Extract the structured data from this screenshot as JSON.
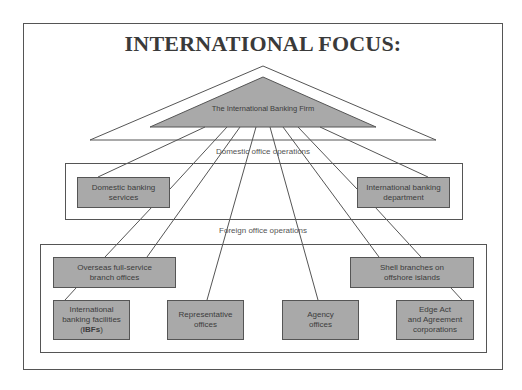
{
  "title": "INTERNATIONAL FOCUS:",
  "firm": {
    "label": "The International Banking Firm"
  },
  "domestic": {
    "section_label": "Domestic office operations",
    "boxes": [
      {
        "line1": "Domestic banking",
        "line2": "services"
      },
      {
        "line1": "International banking",
        "line2": "department"
      }
    ]
  },
  "foreign": {
    "section_label": "Foreign office operations",
    "boxes": [
      {
        "line1": "Overseas full-service",
        "line2": "branch offices"
      },
      {
        "line1": "Shell branches on",
        "line2": "offshore islands"
      },
      {
        "line1": "International",
        "line2": "banking facilities",
        "line3_pre": "(",
        "line3_bold": "IBFs",
        "line3_post": ")"
      },
      {
        "line1": "Representative",
        "line2": "offices"
      },
      {
        "line1": "Agency",
        "line2": "offices"
      },
      {
        "line1": "Edge Act",
        "line2": "and Agreement",
        "line3": "corporations"
      }
    ]
  },
  "colors": {
    "box_fill": "#a9a9a9",
    "stroke": "#555555",
    "text": "#3c3c3c"
  }
}
